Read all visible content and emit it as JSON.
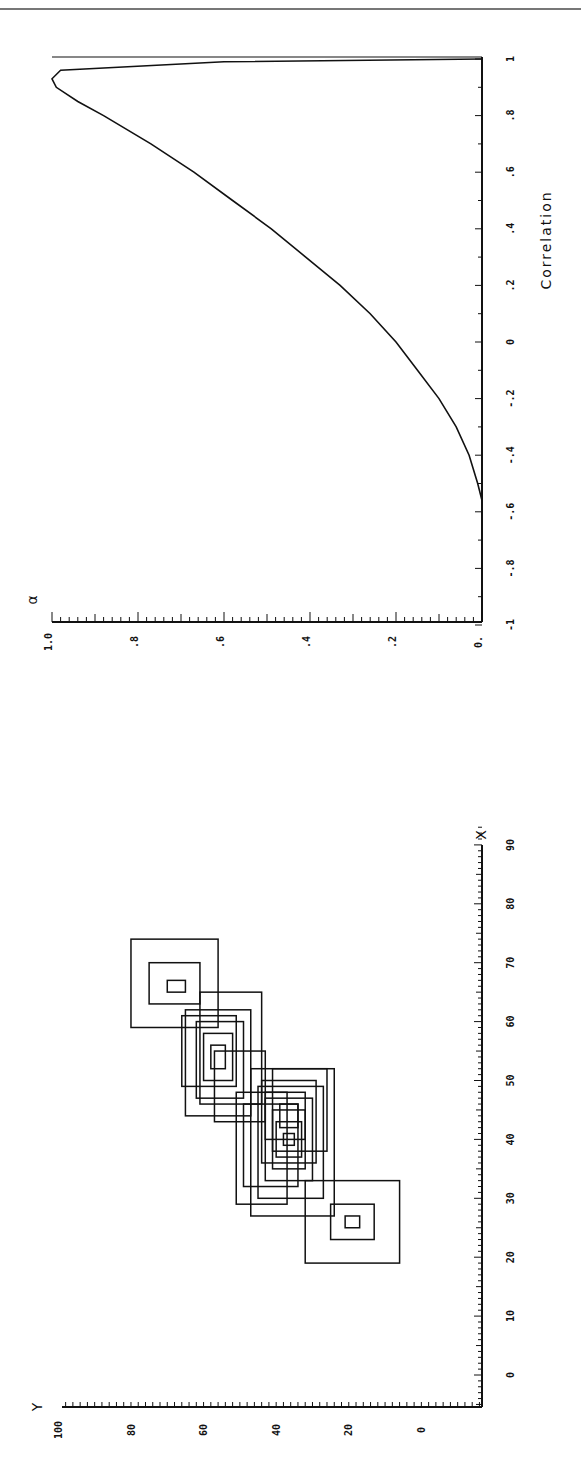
{
  "page": {
    "orientation": "rotated-90-ccw",
    "rule_color": "#777777",
    "ink_color": "#111111"
  },
  "chart_data": [
    {
      "id": "alpha-vs-correlation",
      "type": "line",
      "title": "",
      "xlabel": "Correlation",
      "ylabel": "α",
      "xlim": [
        -1,
        1
      ],
      "ylim": [
        0,
        1.0
      ],
      "x_ticks": [
        "-1",
        "-.8",
        "-.6",
        "-.4",
        "-.2",
        "0",
        ".2",
        ".4",
        ".6",
        ".8",
        "1"
      ],
      "y_ticks": [
        "0.",
        ".2",
        ".4",
        ".6",
        ".8",
        "1.0"
      ],
      "grid": false,
      "legend": null,
      "series": [
        {
          "name": "α",
          "x": [
            -0.56,
            -0.5,
            -0.4,
            -0.3,
            -0.2,
            -0.1,
            0.0,
            0.1,
            0.2,
            0.3,
            0.4,
            0.5,
            0.6,
            0.7,
            0.8,
            0.85,
            0.9,
            0.93,
            0.96,
            0.99,
            1.0
          ],
          "y": [
            0.0,
            0.01,
            0.03,
            0.06,
            0.1,
            0.15,
            0.2,
            0.26,
            0.33,
            0.41,
            0.49,
            0.58,
            0.67,
            0.77,
            0.88,
            0.94,
            0.99,
            1.0,
            0.98,
            0.6,
            0.0
          ]
        }
      ]
    },
    {
      "id": "rectangles-x-y",
      "type": "scatter",
      "title": "",
      "xlabel": "X",
      "ylabel": "Y",
      "xlim": [
        -5,
        93
      ],
      "ylim": [
        -10,
        100
      ],
      "x_ticks": [
        "0",
        "10",
        "20",
        "30",
        "40",
        "50",
        "60",
        "70",
        "80",
        "90"
      ],
      "y_ticks": [
        "0",
        "20",
        "40",
        "60",
        "80",
        "100"
      ],
      "grid": false,
      "legend": null,
      "description": "Nested rectangles (glyph boxes) clustered along a positive diagonal; isolated nested-box glyphs at about (26,20) and (66,69); dense overlapping boxes centred near (40,38).",
      "glyphs": [
        {
          "cx": 26,
          "cy": 20,
          "boxes": [
            [
              19,
              33,
              7,
              33
            ],
            [
              23,
              29,
              14,
              26
            ],
            [
              25,
              27,
              18,
              22
            ]
          ]
        },
        {
          "cx": 66,
          "cy": 69,
          "boxes": [
            [
              59,
              74,
              57,
              81
            ],
            [
              63,
              70,
              62,
              76
            ],
            [
              65,
              67,
              66,
              71
            ]
          ]
        },
        {
          "cx": 40,
          "cy": 38,
          "boxes": [
            [
              27,
              52,
              25,
              48
            ],
            [
              30,
              49,
              28,
              46
            ],
            [
              33,
              47,
              31,
              44
            ],
            [
              35,
              45,
              33,
              42
            ],
            [
              37,
              43,
              34,
              41
            ],
            [
              39,
              41,
              36,
              39
            ],
            [
              29,
              48,
              38,
              52
            ],
            [
              32,
              46,
              35,
              50
            ],
            [
              36,
              50,
              30,
              45
            ],
            [
              38,
              52,
              27,
              42
            ],
            [
              40,
              48,
              33,
              44
            ],
            [
              42,
              46,
              35,
              40
            ]
          ]
        },
        {
          "cx": 53,
          "cy": 57,
          "boxes": [
            [
              44,
              62,
              48,
              66
            ],
            [
              47,
              60,
              50,
              63
            ],
            [
              50,
              58,
              53,
              61
            ],
            [
              52,
              56,
              55,
              59
            ],
            [
              46,
              65,
              45,
              62
            ],
            [
              49,
              61,
              52,
              67
            ],
            [
              43,
              55,
              44,
              58
            ]
          ]
        }
      ]
    }
  ]
}
